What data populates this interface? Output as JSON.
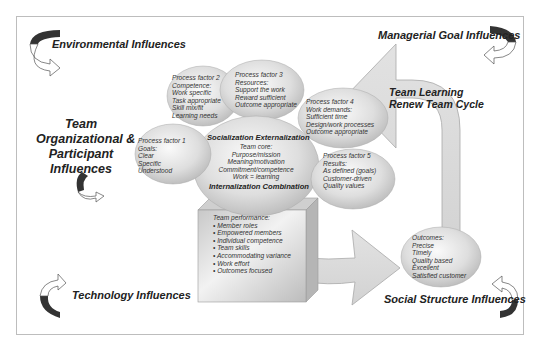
{
  "influences": {
    "environmental": "Environmental Influences",
    "managerial": "Managerial Goal Influences",
    "team_org": [
      "Team",
      "Organizational &",
      "Participant",
      "Influences"
    ],
    "technology": "Technology Influences",
    "social": "Social Structure Influences"
  },
  "cycle": {
    "line1": "Team Learning",
    "line2": "Renew Team Cycle"
  },
  "process_factors": [
    {
      "title": "Process factor 1",
      "lines": [
        "Goals:",
        "Clear",
        "Specific",
        "Understood"
      ]
    },
    {
      "title": "Process factor 2",
      "lines": [
        "Competence:",
        "Work specific",
        "Task appropriate",
        "Skill mix/fit",
        "Learning needs"
      ]
    },
    {
      "title": "Process factor 3",
      "lines": [
        "Resources:",
        "Support the work",
        "Reward sufficient",
        "Outcome appropriate"
      ]
    },
    {
      "title": "Process factor 4",
      "lines": [
        "Work demands:",
        "Sufficient time",
        "Design/work processes",
        "Outcome appropriate"
      ]
    },
    {
      "title": "Process factor 5",
      "lines": [
        "Results:",
        "As defined (goals)",
        "Customer-driven",
        "Quality values"
      ]
    }
  ],
  "core": {
    "top_heading": "Socialization Externalization",
    "lines": [
      "Team core:",
      "Purpose/mission",
      "Meaning/motivation",
      "Commitment/competence",
      "Work = learning"
    ],
    "bottom_heading": "Internalization Combination"
  },
  "performance": {
    "title": "Team performance:",
    "items": [
      "Member roles",
      "Empowered members",
      "Individual competence",
      "Team skills",
      "Accommodating variance",
      "Work effort",
      "Outcomes focused"
    ]
  },
  "outcomes": {
    "lines": [
      "Outcomes:",
      "Precise",
      "Timely",
      "Quality based",
      "Excellent",
      "Satisfied customer"
    ]
  },
  "colors": {
    "bubble_light": "#f4f4f4",
    "bubble_dark": "#bdbdbd",
    "arrow_fill": "#dcdcdc",
    "curl_dark": "#333333",
    "frame": "#bdbdbd"
  }
}
